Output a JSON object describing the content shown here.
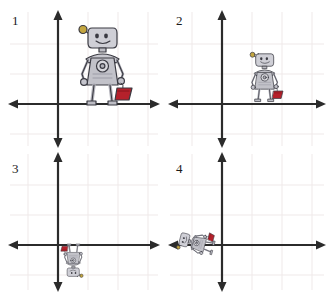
{
  "worksheet": {
    "title": "Robot transformations on coordinate grids",
    "background_color": "#ffffff",
    "axis_color": "#2b2b2b",
    "grid_color": "#efe9e9",
    "label_color": "#1a1a1a",
    "robot_body_color": "#b9b9bd",
    "robot_outline_color": "#3a3a42",
    "robot_bag_color": "#b5212b",
    "robot_antenna_color": "#b59a33"
  },
  "panels": [
    {
      "label": "1",
      "name": "panel-1",
      "origin": {
        "x": 58,
        "y": 104
      },
      "grid_spacing": 30,
      "x_axis": {
        "y": 104,
        "from_x": 10,
        "to_x": 158
      },
      "y_axis": {
        "x": 58,
        "from_y": 12,
        "to_y": 146
      },
      "robot": {
        "scale": 1.0,
        "rotation_deg": 0,
        "center_x": 103,
        "center_y": 67,
        "description": "robot standing upright holding red bag, original size"
      }
    },
    {
      "label": "2",
      "name": "panel-2",
      "origin": {
        "x": 58,
        "y": 104
      },
      "grid_spacing": 30,
      "x_axis": {
        "y": 104,
        "from_x": 6,
        "to_x": 160
      },
      "y_axis": {
        "x": 58,
        "from_y": 12,
        "to_y": 146
      },
      "robot": {
        "scale": 0.62,
        "rotation_deg": 0,
        "center_x": 101,
        "center_y": 78,
        "description": "robot standing upright holding red bag, reduced size"
      }
    },
    {
      "label": "3",
      "name": "panel-3",
      "origin": {
        "x": 58,
        "y": 97
      },
      "grid_spacing": 30,
      "x_axis": {
        "y": 97,
        "from_x": 10,
        "to_x": 158
      },
      "y_axis": {
        "x": 58,
        "from_y": 6,
        "to_y": 142
      },
      "robot": {
        "scale": 0.42,
        "rotation_deg": 180,
        "center_x": 73,
        "center_y": 112,
        "description": "robot upside down below the x-axis, small size"
      }
    },
    {
      "label": "4",
      "name": "panel-4",
      "origin": {
        "x": 58,
        "y": 97
      },
      "grid_spacing": 30,
      "x_axis": {
        "y": 97,
        "from_x": 6,
        "to_x": 160
      },
      "y_axis": {
        "x": 58,
        "from_y": 6,
        "to_y": 142
      },
      "robot": {
        "scale": 0.45,
        "rotation_deg": -75,
        "center_x": 33,
        "center_y": 95,
        "description": "robot rotated on its side left of the y-axis, small size"
      }
    }
  ]
}
